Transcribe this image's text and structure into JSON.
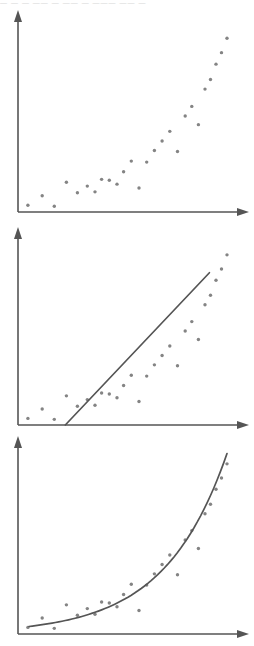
{
  "figure": {
    "title": "",
    "width": 254,
    "height": 646,
    "background": "#ffffff",
    "axis_color": "#555555",
    "dot_color": "#848484",
    "fit_color": "#555555",
    "cropped_caption_sliver": "— —  — —— —  —— — ———  —— —"
  },
  "chart_data": [
    {
      "type": "scatter",
      "title": "",
      "subtitle": "",
      "xlabel": "",
      "ylabel": "",
      "panel": 1,
      "panel_name": "raw-scatter",
      "grid": false,
      "legend": false,
      "axis_arrows": true,
      "xlim": [
        0,
        100
      ],
      "ylim": [
        0,
        100
      ],
      "tick_labels_x": [],
      "tick_labels_y": [],
      "annotations": [],
      "fit": null,
      "x": [
        4.5,
        11.0,
        16.5,
        22.0,
        27.0,
        31.5,
        35.0,
        38.0,
        41.5,
        45.0,
        48.0,
        51.5,
        55.0,
        58.5,
        62.0,
        65.5,
        69.0,
        72.5,
        76.0,
        79.0,
        82.0,
        85.0,
        87.5,
        90.0,
        92.5,
        95.0
      ],
      "y": [
        3.5,
        8.5,
        3.0,
        15.5,
        10.0,
        13.5,
        10.5,
        17.0,
        16.5,
        14.5,
        21.0,
        26.5,
        12.5,
        26.0,
        32.0,
        37.0,
        42.0,
        31.5,
        50.0,
        55.0,
        45.5,
        64.0,
        69.0,
        77.0,
        83.0,
        90.5
      ]
    },
    {
      "type": "scatter",
      "title": "",
      "subtitle": "",
      "xlabel": "",
      "ylabel": "",
      "panel": 2,
      "panel_name": "linear-fit-scatter",
      "grid": false,
      "legend": false,
      "axis_arrows": true,
      "xlim": [
        0,
        100
      ],
      "ylim": [
        0,
        100
      ],
      "tick_labels_x": [],
      "tick_labels_y": [],
      "annotations": [],
      "fit": {
        "kind": "line",
        "label": "linear trend line",
        "x_start": 21.5,
        "y_start": 0.0,
        "x_end": 87.0,
        "y_end": 81.0
      },
      "x": [
        4.5,
        11.0,
        16.5,
        22.0,
        27.0,
        31.5,
        35.0,
        38.0,
        41.5,
        45.0,
        48.0,
        51.5,
        55.0,
        58.5,
        62.0,
        65.5,
        69.0,
        72.5,
        76.0,
        79.0,
        82.0,
        85.0,
        87.5,
        90.0,
        92.5,
        95.0
      ],
      "y": [
        3.5,
        8.5,
        3.0,
        15.5,
        10.0,
        13.5,
        10.5,
        17.0,
        16.5,
        14.5,
        21.0,
        26.5,
        12.5,
        26.0,
        32.0,
        37.0,
        42.0,
        31.5,
        50.0,
        55.0,
        45.5,
        64.0,
        69.0,
        77.0,
        83.0,
        90.5
      ]
    },
    {
      "type": "scatter",
      "title": "",
      "subtitle": "",
      "xlabel": "",
      "ylabel": "",
      "panel": 3,
      "panel_name": "exponential-fit-scatter",
      "grid": false,
      "legend": false,
      "axis_arrows": true,
      "xlim": [
        0,
        100
      ],
      "ylim": [
        0,
        100
      ],
      "tick_labels_x": [],
      "tick_labels_y": [],
      "annotations": [],
      "fit": {
        "kind": "exponential-curve",
        "label": "exponential trend curve",
        "x_start": 5.0,
        "y_start": 4.0,
        "x_end": 95.0,
        "y_end": 96.0
      },
      "x": [
        4.5,
        11.0,
        16.5,
        22.0,
        27.0,
        31.5,
        35.0,
        38.0,
        41.5,
        45.0,
        48.0,
        51.5,
        55.0,
        58.5,
        62.0,
        65.5,
        69.0,
        72.5,
        76.0,
        79.0,
        82.0,
        85.0,
        87.5,
        90.0,
        92.5,
        95.0
      ],
      "y": [
        3.5,
        8.5,
        3.0,
        15.5,
        10.0,
        13.5,
        10.5,
        17.0,
        16.5,
        14.5,
        21.0,
        26.5,
        12.5,
        26.0,
        32.0,
        37.0,
        42.0,
        31.5,
        50.0,
        55.0,
        45.5,
        64.0,
        69.0,
        77.0,
        83.0,
        90.5
      ]
    }
  ]
}
